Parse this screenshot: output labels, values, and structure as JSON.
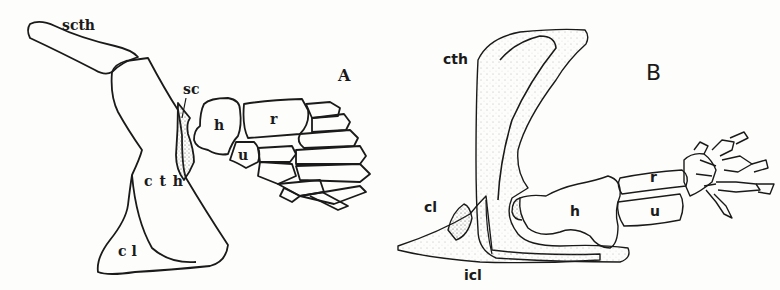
{
  "figure": {
    "panels": [
      {
        "id": "A",
        "letter": "A",
        "description": "Fish pectoral girdle and fin",
        "labels": {
          "scth": "scth",
          "sc": "sc",
          "cth": "c t h",
          "cl": "c l",
          "h": "h",
          "r": "r",
          "u": "u"
        }
      },
      {
        "id": "B",
        "letter": "B",
        "description": "Tetrapod pectoral girdle and forelimb",
        "labels": {
          "cth": "cth",
          "cl": "cl",
          "icl": "icl",
          "h": "h",
          "r": "r",
          "u": "u"
        }
      }
    ],
    "colors": {
      "background": "#fdfdfb",
      "ink": "#1a1a1a",
      "stipple": "#555555"
    }
  }
}
